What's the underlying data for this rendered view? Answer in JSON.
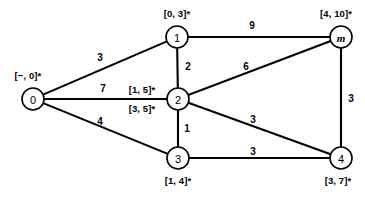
{
  "chart_data": {
    "type": "diagram",
    "title": "",
    "nodes": [
      {
        "id": "0",
        "label": "0",
        "x": 33,
        "y": 99,
        "r": 11,
        "italic": false,
        "annotations": [
          {
            "text": "[−, 0]*",
            "x": 28,
            "y": 76
          }
        ]
      },
      {
        "id": "1",
        "label": "1",
        "x": 177,
        "y": 37,
        "r": 11,
        "italic": false,
        "annotations": [
          {
            "text": "[0, 3]*",
            "x": 177,
            "y": 14
          }
        ]
      },
      {
        "id": "2",
        "label": "2",
        "x": 178,
        "y": 99,
        "r": 11,
        "italic": false,
        "annotations": [
          {
            "text": "[1, 5]*",
            "x": 142,
            "y": 90
          },
          {
            "text": "[3, 5]*",
            "x": 142,
            "y": 109
          }
        ]
      },
      {
        "id": "3",
        "label": "3",
        "x": 178,
        "y": 158,
        "r": 11,
        "italic": false,
        "annotations": [
          {
            "text": "[1, 4]*",
            "x": 178,
            "y": 181
          }
        ]
      },
      {
        "id": "m",
        "label": "m",
        "x": 341,
        "y": 37,
        "r": 11,
        "italic": true,
        "annotations": [
          {
            "text": "[4, 10]*",
            "x": 336,
            "y": 14
          }
        ]
      },
      {
        "id": "4",
        "label": "4",
        "x": 341,
        "y": 158,
        "r": 11,
        "italic": false,
        "annotations": [
          {
            "text": "[3, 7]*",
            "x": 338,
            "y": 181
          }
        ]
      }
    ],
    "edges": [
      {
        "from": "0",
        "to": "1",
        "weight": "3",
        "lx": 100,
        "ly": 58
      },
      {
        "from": "0",
        "to": "2",
        "weight": "7",
        "lx": 103,
        "ly": 89
      },
      {
        "from": "0",
        "to": "3",
        "weight": "4",
        "lx": 100,
        "ly": 122
      },
      {
        "from": "1",
        "to": "m",
        "weight": "9",
        "lx": 252,
        "ly": 26
      },
      {
        "from": "1",
        "to": "2",
        "weight": "2",
        "lx": 188,
        "ly": 67
      },
      {
        "from": "2",
        "to": "m",
        "weight": "6",
        "lx": 246,
        "ly": 67
      },
      {
        "from": "2",
        "to": "3",
        "weight": "1",
        "lx": 187,
        "ly": 129
      },
      {
        "from": "2",
        "to": "4",
        "weight": "3",
        "lx": 253,
        "ly": 120
      },
      {
        "from": "3",
        "to": "4",
        "weight": "3",
        "lx": 253,
        "ly": 152
      },
      {
        "from": "m",
        "to": "4",
        "weight": "3",
        "lx": 351,
        "ly": 99
      }
    ],
    "colors": {
      "stroke": "#000000",
      "fill": "#ffffff",
      "background": "#ffffff"
    }
  }
}
